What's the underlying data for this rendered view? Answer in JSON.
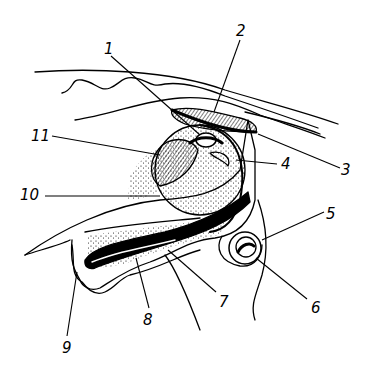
{
  "diagram": {
    "type": "anatomical-cross-section",
    "style": "black ink line drawing with stippling",
    "colors": {
      "ink": "#000000",
      "background": "#ffffff"
    },
    "labels": [
      {
        "id": "1",
        "text": "1",
        "x": 104,
        "y": 42
      },
      {
        "id": "2",
        "text": "2",
        "x": 236,
        "y": 24
      },
      {
        "id": "3",
        "text": "3",
        "x": 341,
        "y": 163
      },
      {
        "id": "4",
        "text": "4",
        "x": 281,
        "y": 157
      },
      {
        "id": "5",
        "text": "5",
        "x": 326,
        "y": 207
      },
      {
        "id": "6",
        "text": "6",
        "x": 311,
        "y": 301
      },
      {
        "id": "7",
        "text": "7",
        "x": 219,
        "y": 295
      },
      {
        "id": "8",
        "text": "8",
        "x": 143,
        "y": 313
      },
      {
        "id": "9",
        "text": "9",
        "x": 62,
        "y": 341
      },
      {
        "id": "10",
        "text": "10",
        "x": 20,
        "y": 188
      },
      {
        "id": "11",
        "text": "11",
        "x": 31,
        "y": 129
      }
    ]
  }
}
